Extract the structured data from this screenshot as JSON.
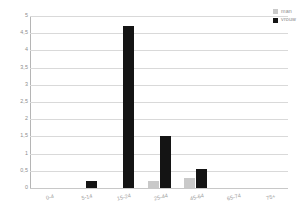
{
  "chart_data": {
    "type": "bar",
    "title": "",
    "xlabel": "",
    "ylabel": "",
    "categories": [
      "0-4",
      "5-14",
      "15-24",
      "25-44",
      "45-64",
      "65-74",
      "75+"
    ],
    "series": [
      {
        "name": "man",
        "color": "#c9c9c9",
        "values": [
          0,
          0,
          0,
          0.2,
          0.3,
          0,
          0
        ]
      },
      {
        "name": "vrouw",
        "color": "#141414",
        "values": [
          0,
          0.2,
          4.7,
          1.5,
          0.55,
          0,
          0
        ]
      }
    ],
    "ylim": [
      0,
      5
    ],
    "yticks": [
      "0",
      "0,5",
      "1",
      "1,5",
      "2",
      "2,5",
      "3",
      "3,5",
      "4",
      "4,5",
      "5"
    ],
    "ytick_values": [
      0,
      0.5,
      1,
      1.5,
      2,
      2.5,
      3,
      3.5,
      4,
      4.5,
      5
    ],
    "grid": true,
    "legend_position": "top-right",
    "axis_colors": {
      "gridline": "#d9d9d9",
      "axis": "#b5b5b5",
      "tick_text": "#8d8d8d"
    }
  }
}
